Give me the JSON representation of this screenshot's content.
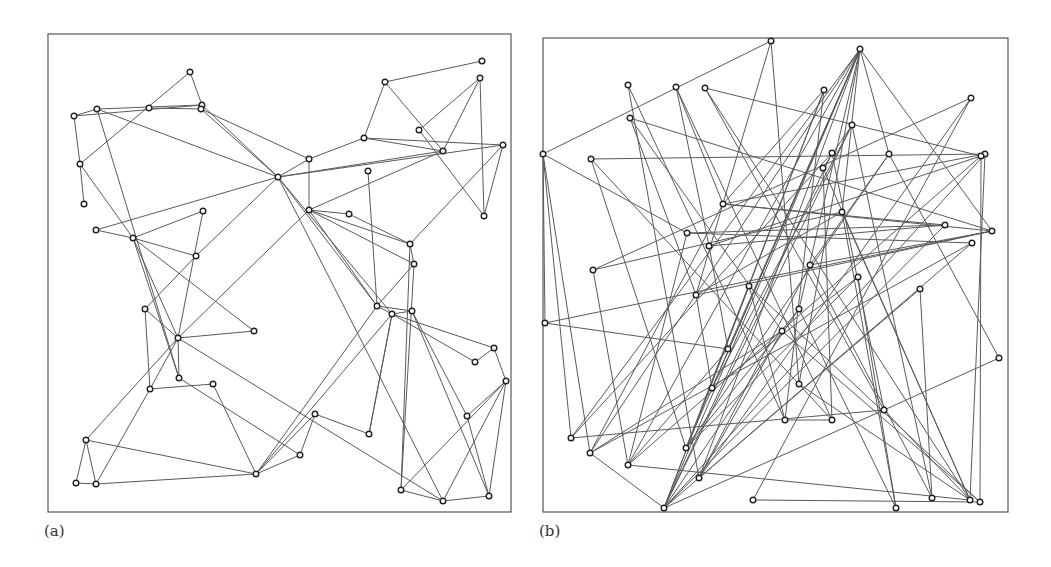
{
  "figure": {
    "panels": [
      {
        "id": "a",
        "label": "(a)",
        "label_pos": [
          44,
          536
        ],
        "frame": {
          "x": 48,
          "y": 34,
          "w": 463,
          "h": 478
        },
        "nodes": [
          [
            190,
            72
          ],
          [
            97,
            109
          ],
          [
            74,
            116
          ],
          [
            149,
            108
          ],
          [
            202,
            105
          ],
          [
            201,
            109
          ],
          [
            80,
            164
          ],
          [
            84,
            204
          ],
          [
            278,
            177
          ],
          [
            203,
            211
          ],
          [
            96,
            230
          ],
          [
            133,
            238
          ],
          [
            196,
            256
          ],
          [
            145,
            309
          ],
          [
            178,
            338
          ],
          [
            254,
            331
          ],
          [
            179,
            378
          ],
          [
            213,
            384
          ],
          [
            150,
            389
          ],
          [
            86,
            440
          ],
          [
            256,
            474
          ],
          [
            76,
            483
          ],
          [
            96,
            484
          ],
          [
            482,
            61
          ],
          [
            480,
            78
          ],
          [
            385,
            82
          ],
          [
            419,
            130
          ],
          [
            364,
            138
          ],
          [
            503,
            145
          ],
          [
            443,
            151
          ],
          [
            309,
            159
          ],
          [
            368,
            171
          ],
          [
            309,
            210
          ],
          [
            349,
            214
          ],
          [
            484,
            216
          ],
          [
            410,
            244
          ],
          [
            414,
            264
          ],
          [
            377,
            306
          ],
          [
            392,
            314
          ],
          [
            412,
            311
          ],
          [
            494,
            348
          ],
          [
            475,
            362
          ],
          [
            506,
            381
          ],
          [
            315,
            414
          ],
          [
            369,
            434
          ],
          [
            467,
            416
          ],
          [
            300,
            455
          ],
          [
            401,
            490
          ],
          [
            443,
            501
          ],
          [
            489,
            496
          ]
        ],
        "edges": [
          [
            0,
            6
          ],
          [
            0,
            4
          ],
          [
            2,
            1
          ],
          [
            2,
            4
          ],
          [
            1,
            4
          ],
          [
            3,
            5
          ],
          [
            2,
            6
          ],
          [
            1,
            8
          ],
          [
            6,
            7
          ],
          [
            6,
            11
          ],
          [
            1,
            16
          ],
          [
            5,
            8
          ],
          [
            5,
            30
          ],
          [
            4,
            8
          ],
          [
            10,
            8
          ],
          [
            10,
            11
          ],
          [
            11,
            9
          ],
          [
            11,
            12
          ],
          [
            11,
            15
          ],
          [
            11,
            14
          ],
          [
            11,
            16
          ],
          [
            9,
            14
          ],
          [
            12,
            8
          ],
          [
            12,
            13
          ],
          [
            13,
            14
          ],
          [
            13,
            18
          ],
          [
            14,
            15
          ],
          [
            14,
            32
          ],
          [
            14,
            16
          ],
          [
            14,
            18
          ],
          [
            14,
            19
          ],
          [
            14,
            48
          ],
          [
            16,
            46
          ],
          [
            17,
            18
          ],
          [
            17,
            20
          ],
          [
            19,
            20
          ],
          [
            19,
            21
          ],
          [
            19,
            22
          ],
          [
            21,
            22
          ],
          [
            22,
            20
          ],
          [
            18,
            22
          ],
          [
            20,
            37
          ],
          [
            20,
            38
          ],
          [
            20,
            46
          ],
          [
            8,
            30
          ],
          [
            8,
            29
          ],
          [
            8,
            28
          ],
          [
            8,
            37
          ],
          [
            8,
            38
          ],
          [
            8,
            48
          ],
          [
            30,
            27
          ],
          [
            30,
            32
          ],
          [
            27,
            25
          ],
          [
            27,
            28
          ],
          [
            27,
            29
          ],
          [
            25,
            23
          ],
          [
            25,
            29
          ],
          [
            24,
            26
          ],
          [
            24,
            29
          ],
          [
            24,
            34
          ],
          [
            26,
            34
          ],
          [
            28,
            34
          ],
          [
            28,
            35
          ],
          [
            31,
            37
          ],
          [
            32,
            33
          ],
          [
            32,
            35
          ],
          [
            32,
            36
          ],
          [
            32,
            37
          ],
          [
            32,
            29
          ],
          [
            33,
            35
          ],
          [
            36,
            35
          ],
          [
            36,
            37
          ],
          [
            36,
            47
          ],
          [
            37,
            39
          ],
          [
            37,
            38
          ],
          [
            38,
            39
          ],
          [
            38,
            44
          ],
          [
            38,
            40
          ],
          [
            38,
            41
          ],
          [
            39,
            45
          ],
          [
            39,
            49
          ],
          [
            40,
            41
          ],
          [
            40,
            42
          ],
          [
            42,
            45
          ],
          [
            42,
            49
          ],
          [
            42,
            47
          ],
          [
            42,
            48
          ],
          [
            45,
            49
          ],
          [
            43,
            44
          ],
          [
            43,
            20
          ],
          [
            43,
            46
          ],
          [
            35,
            47
          ],
          [
            47,
            48
          ],
          [
            48,
            49
          ],
          [
            44,
            38
          ]
        ]
      },
      {
        "id": "b",
        "label": "(b)",
        "label_pos": [
          539,
          536
        ],
        "frame": {
          "x": 543,
          "y": 38,
          "w": 465,
          "h": 474
        },
        "nodes": [
          [
            771,
            41
          ],
          [
            628,
            85
          ],
          [
            676,
            87
          ],
          [
            705,
            88
          ],
          [
            630,
            118
          ],
          [
            543,
            154
          ],
          [
            591,
            159
          ],
          [
            723,
            204
          ],
          [
            687,
            233
          ],
          [
            709,
            246
          ],
          [
            593,
            270
          ],
          [
            860,
            49
          ],
          [
            824,
            90
          ],
          [
            971,
            98
          ],
          [
            852,
            125
          ],
          [
            832,
            153
          ],
          [
            889,
            154
          ],
          [
            823,
            168
          ],
          [
            985,
            154
          ],
          [
            981,
            156
          ],
          [
            842,
            212
          ],
          [
            945,
            225
          ],
          [
            992,
            231
          ],
          [
            972,
            243
          ],
          [
            810,
            265
          ],
          [
            858,
            277
          ],
          [
            696,
            295
          ],
          [
            749,
            286
          ],
          [
            545,
            323
          ],
          [
            782,
            331
          ],
          [
            728,
            349
          ],
          [
            712,
            388
          ],
          [
            785,
            420
          ],
          [
            571,
            438
          ],
          [
            686,
            448
          ],
          [
            590,
            453
          ],
          [
            628,
            465
          ],
          [
            699,
            478
          ],
          [
            753,
            500
          ],
          [
            664,
            508
          ],
          [
            920,
            289
          ],
          [
            799,
            309
          ],
          [
            999,
            358
          ],
          [
            799,
            384
          ],
          [
            884,
            410
          ],
          [
            832,
            420
          ],
          [
            932,
            498
          ],
          [
            970,
            500
          ],
          [
            980,
            502
          ],
          [
            896,
            508
          ]
        ],
        "edges": [
          [
            0,
            5
          ],
          [
            0,
            26
          ],
          [
            0,
            43
          ],
          [
            5,
            8
          ],
          [
            5,
            35
          ],
          [
            5,
            33
          ],
          [
            5,
            28
          ],
          [
            1,
            32
          ],
          [
            1,
            37
          ],
          [
            2,
            9
          ],
          [
            2,
            7
          ],
          [
            2,
            45
          ],
          [
            3,
            19
          ],
          [
            3,
            47
          ],
          [
            3,
            44
          ],
          [
            4,
            22
          ],
          [
            4,
            29
          ],
          [
            4,
            26
          ],
          [
            6,
            18
          ],
          [
            6,
            34
          ],
          [
            6,
            45
          ],
          [
            7,
            22
          ],
          [
            7,
            35
          ],
          [
            7,
            21
          ],
          [
            8,
            23
          ],
          [
            8,
            36
          ],
          [
            9,
            21
          ],
          [
            9,
            30
          ],
          [
            10,
            13
          ],
          [
            10,
            20
          ],
          [
            11,
            16
          ],
          [
            11,
            22
          ],
          [
            11,
            31
          ],
          [
            11,
            33
          ],
          [
            11,
            35
          ],
          [
            11,
            36
          ],
          [
            11,
            37
          ],
          [
            11,
            39
          ],
          [
            11,
            34
          ],
          [
            11,
            43
          ],
          [
            11,
            41
          ],
          [
            11,
            20
          ],
          [
            11,
            30
          ],
          [
            12,
            39
          ],
          [
            12,
            7
          ],
          [
            12,
            34
          ],
          [
            12,
            32
          ],
          [
            13,
            37
          ],
          [
            13,
            38
          ],
          [
            14,
            46
          ],
          [
            14,
            31
          ],
          [
            14,
            39
          ],
          [
            14,
            17
          ],
          [
            15,
            33
          ],
          [
            15,
            44
          ],
          [
            15,
            39
          ],
          [
            16,
            34
          ],
          [
            16,
            42
          ],
          [
            16,
            24
          ],
          [
            17,
            47
          ],
          [
            17,
            45
          ],
          [
            18,
            39
          ],
          [
            18,
            7
          ],
          [
            18,
            47
          ],
          [
            19,
            48
          ],
          [
            19,
            36
          ],
          [
            19,
            9
          ],
          [
            20,
            47
          ],
          [
            20,
            26
          ],
          [
            20,
            49
          ],
          [
            21,
            8
          ],
          [
            21,
            39
          ],
          [
            22,
            24
          ],
          [
            22,
            28
          ],
          [
            22,
            26
          ],
          [
            23,
            35
          ],
          [
            23,
            39
          ],
          [
            24,
            46
          ],
          [
            24,
            37
          ],
          [
            25,
            34
          ],
          [
            25,
            49
          ],
          [
            26,
            31
          ],
          [
            27,
            32
          ],
          [
            27,
            48
          ],
          [
            28,
            30
          ],
          [
            29,
            48
          ],
          [
            29,
            37
          ],
          [
            30,
            36
          ],
          [
            31,
            25
          ],
          [
            32,
            45
          ],
          [
            33,
            44
          ],
          [
            34,
            41
          ],
          [
            35,
            29
          ],
          [
            35,
            39
          ],
          [
            36,
            47
          ],
          [
            37,
            40
          ],
          [
            38,
            48
          ],
          [
            39,
            27
          ],
          [
            39,
            41
          ],
          [
            40,
            46
          ],
          [
            41,
            49
          ],
          [
            42,
            44
          ],
          [
            43,
            47
          ],
          [
            44,
            39
          ],
          [
            44,
            47
          ],
          [
            10,
            36
          ]
        ]
      }
    ],
    "style": {
      "line_color": "#5a5a5a",
      "node_stroke": "#222222",
      "node_fill": "#ffffff",
      "frame_color": "#555555",
      "node_radius": 2.8
    }
  }
}
